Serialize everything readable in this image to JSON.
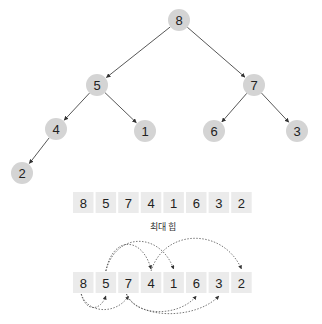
{
  "diagram": {
    "tree": {
      "nodes": [
        {
          "id": "n8",
          "label": "8",
          "cx": 179,
          "cy": 20
        },
        {
          "id": "n5",
          "label": "5",
          "cx": 97,
          "cy": 85
        },
        {
          "id": "n7",
          "label": "7",
          "cx": 254,
          "cy": 85
        },
        {
          "id": "n4",
          "label": "4",
          "cx": 56,
          "cy": 129
        },
        {
          "id": "n1",
          "label": "1",
          "cx": 145,
          "cy": 131
        },
        {
          "id": "n6",
          "label": "6",
          "cx": 214,
          "cy": 131
        },
        {
          "id": "n3",
          "label": "3",
          "cx": 297,
          "cy": 131
        },
        {
          "id": "n2",
          "label": "2",
          "cx": 22,
          "cy": 173
        }
      ],
      "edges": [
        [
          "n8",
          "n5"
        ],
        [
          "n8",
          "n7"
        ],
        [
          "n5",
          "n4"
        ],
        [
          "n5",
          "n1"
        ],
        [
          "n7",
          "n6"
        ],
        [
          "n7",
          "n3"
        ],
        [
          "n4",
          "n2"
        ]
      ],
      "node_fill": "#d4d4d4",
      "edge_color": "#444444"
    },
    "array": {
      "values": [
        "8",
        "5",
        "7",
        "4",
        "1",
        "6",
        "3",
        "2"
      ],
      "caption": "최대 힙",
      "cell_fill": "#ebebeb"
    },
    "array_links": {
      "values": [
        "8",
        "5",
        "7",
        "4",
        "1",
        "6",
        "3",
        "2"
      ],
      "arcs_above": [
        [
          1,
          3
        ],
        [
          1,
          4
        ],
        [
          3,
          7
        ]
      ],
      "arcs_below": [
        [
          0,
          1
        ],
        [
          0,
          2
        ],
        [
          2,
          5
        ],
        [
          2,
          6
        ]
      ],
      "arc_color": "#555555"
    }
  }
}
